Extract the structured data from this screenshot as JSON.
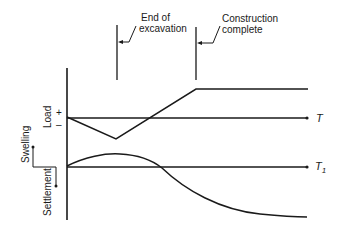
{
  "annotations": {
    "end_of_excavation": {
      "line1": "End of",
      "line2": "excavation"
    },
    "construction_complete": {
      "line1": "Construction",
      "line2": "complete"
    }
  },
  "axes": {
    "load_label": "Load",
    "load_plus": "+",
    "load_minus": "–",
    "swelling_label": "Swelling",
    "settlement_label": "Settlement",
    "time_axis_top": "T",
    "time_axis_bottom": "T",
    "time_axis_bottom_sub": "1"
  },
  "colors": {
    "line": "#1a1a1a",
    "background": "#ffffff"
  }
}
